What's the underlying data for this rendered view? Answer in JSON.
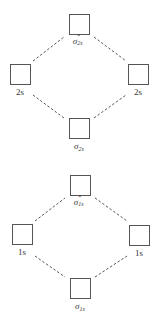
{
  "diagrams": [
    {
      "name": "2s-mo-diagram",
      "antibonding": {
        "symbol": "σ",
        "superscript": "*",
        "subscript": "2s",
        "box": {
          "x": 69,
          "y": 14
        }
      },
      "atomic_left": {
        "label": "2s",
        "box": {
          "x": 10,
          "y": 64
        }
      },
      "atomic_right": {
        "label": "2s",
        "box": {
          "x": 128,
          "y": 64
        }
      },
      "bonding": {
        "symbol": "σ",
        "subscript": "2s",
        "box": {
          "x": 69,
          "y": 118
        }
      }
    },
    {
      "name": "1s-mo-diagram",
      "antibonding": {
        "symbol": "σ",
        "superscript": "*",
        "subscript": "1s",
        "box": {
          "x": 70,
          "y": 175
        }
      },
      "atomic_left": {
        "label": "1s",
        "box": {
          "x": 12,
          "y": 224
        }
      },
      "atomic_right": {
        "label": "1s",
        "box": {
          "x": 129,
          "y": 225
        }
      },
      "bonding": {
        "symbol": "σ",
        "subscript": "1s",
        "box": {
          "x": 70,
          "y": 278
        }
      }
    }
  ],
  "style": {
    "line_color": "#555555",
    "box_border_color": "#555555",
    "text_color": "#333333",
    "background": "#ffffff"
  }
}
